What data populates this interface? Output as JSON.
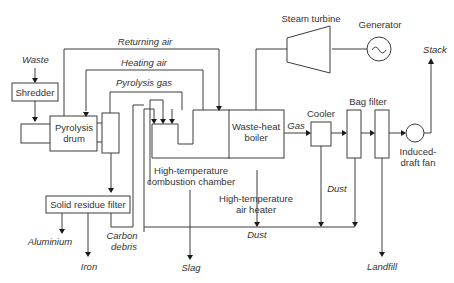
{
  "diagram": {
    "colors": {
      "line": "#3c3c3c",
      "text": "#333333",
      "background": "#ffffff"
    },
    "units": [
      {
        "id": "shredder",
        "label": "Shredder"
      },
      {
        "id": "pyrolysis-drum",
        "label_line1": "Pyrolysis",
        "label_line2": "drum"
      },
      {
        "id": "solid-residue-filter",
        "label": "Solid residue filter"
      },
      {
        "id": "combustion-chamber",
        "label_line1": "High-temperature",
        "label_line2": "combustion chamber"
      },
      {
        "id": "waste-heat-boiler",
        "label_line1": "Waste-heat",
        "label_line2": "boiler"
      },
      {
        "id": "air-heater",
        "label_line1": "High-temperature",
        "label_line2": "air heater"
      },
      {
        "id": "steam-turbine",
        "label": "Steam turbine"
      },
      {
        "id": "generator",
        "label": "Generator"
      },
      {
        "id": "cooler",
        "label": "Cooler"
      },
      {
        "id": "bag-filter",
        "label": "Bag filter"
      },
      {
        "id": "induced-draft-fan",
        "label_line1": "Induced-",
        "label_line2": "draft fan"
      }
    ],
    "streams": {
      "waste": "Waste",
      "returning_air": "Returning air",
      "heating_air": "Heating air",
      "pyrolysis_gas": "Pyrolysis gas",
      "gas": "Gas",
      "stack": "Stack",
      "dust_cooler": "Dust",
      "dust_bottom": "Dust",
      "aluminium": "Aluminium",
      "iron": "Iron",
      "carbon_line1": "Carbon",
      "carbon_line2": "debris",
      "slag": "Slag",
      "landfill": "Landfill"
    },
    "generator_symbol": "~"
  }
}
